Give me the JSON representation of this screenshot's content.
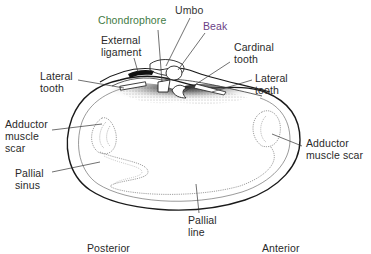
{
  "figure": {
    "labels": {
      "umbo": "Umbo",
      "chondrophore": "Chondrophore",
      "beak": "Beak",
      "external_ligament": "External\nligament",
      "cardinal_tooth": "Cardinal\ntooth",
      "lateral_tooth_left": "Lateral\ntooth",
      "lateral_tooth_right": "Lateral\ntooth",
      "adductor_scar_left": "Adductor\nmuscle\nscar",
      "adductor_scar_right": "Adductor\nmuscle scar",
      "pallial_sinus": "Pallial\nsinus",
      "pallial_line": "Pallial\nline",
      "posterior": "Posterior",
      "anterior": "Anterior"
    },
    "colors": {
      "text_default": "#2a2a2a",
      "chondrophore": "#3f7a45",
      "beak": "#6a3f86",
      "line": "#333333",
      "shell_outline": "#1a1a1a"
    }
  }
}
